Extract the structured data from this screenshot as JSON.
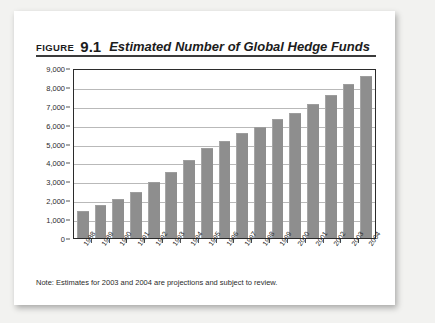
{
  "heading": {
    "figure_word": "FIGURE",
    "figure_number": "9.1",
    "title": "Estimated Number of Global Hedge Funds"
  },
  "note": "Note: Estimates for 2003 and 2004 are projections and subject to review.",
  "colors": {
    "page_background": "#f2f2f0",
    "card_background": "#ffffff",
    "bar_fill": "#8e8e8e",
    "axis": "#2b2b2b",
    "gridline": "#b9b9b9",
    "title_rule": "#3b3b3b"
  },
  "chart_data": {
    "type": "bar",
    "title": "Estimated Number of Global Hedge Funds",
    "xlabel": "",
    "ylabel": "",
    "ylim": [
      0,
      9000
    ],
    "ytick_step": 1000,
    "ytick_labels": [
      "9,000",
      "8,000",
      "7,000",
      "6,000",
      "5,000",
      "4,000",
      "3,000",
      "2,000",
      "1,000",
      "0"
    ],
    "ytick_values": [
      9000,
      8000,
      7000,
      6000,
      5000,
      4000,
      3000,
      2000,
      1000,
      0
    ],
    "grid": true,
    "legend": false,
    "categories": [
      "1988",
      "1989",
      "1990",
      "1991",
      "1992",
      "1993",
      "1994",
      "1995",
      "1996",
      "1997",
      "1998",
      "1999",
      "2000",
      "2001",
      "2002",
      "2003",
      "2004"
    ],
    "values": [
      1400,
      1700,
      2000,
      2400,
      2900,
      3450,
      4100,
      4700,
      5100,
      5500,
      5850,
      6250,
      6550,
      7050,
      7500,
      8100,
      8500
    ],
    "annotations": [
      "Note: Estimates for 2003 and 2004 are projections and subject to review."
    ]
  }
}
